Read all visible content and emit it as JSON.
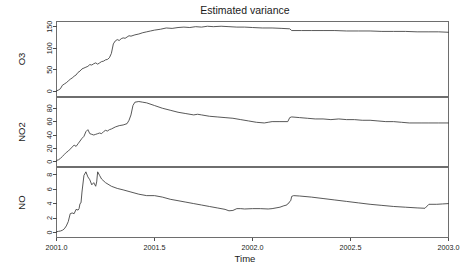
{
  "chart_data": {
    "type": "line",
    "title": "Estimated variance",
    "xlabel": "Time",
    "ylabel": "",
    "grid": false,
    "legend": "none",
    "layout": "3 stacked panels sharing one x axis",
    "xlim": [
      2001.0,
      2003.0
    ],
    "xticks": [
      2001.0,
      2001.5,
      2002.0,
      2002.5,
      2003.0
    ],
    "xticklabels": [
      "2001.0",
      "2001.5",
      "2002.0",
      "2002.5",
      "2003.0"
    ],
    "panels": [
      {
        "name": "O3",
        "ylabel": "O3",
        "ylim": [
          -12,
          162
        ],
        "yticks": [
          0,
          50,
          100,
          150
        ],
        "yticklabels": [
          "0",
          "50",
          "100",
          "150"
        ],
        "series": [
          {
            "name": "O3",
            "x": [
              2001.0,
              2001.01,
              2001.02,
              2001.03,
              2001.04,
              2001.05,
              2001.06,
              2001.07,
              2001.08,
              2001.09,
              2001.1,
              2001.11,
              2001.12,
              2001.13,
              2001.14,
              2001.15,
              2001.16,
              2001.17,
              2001.18,
              2001.19,
              2001.2,
              2001.21,
              2001.22,
              2001.23,
              2001.24,
              2001.25,
              2001.26,
              2001.27,
              2001.28,
              2001.29,
              2001.3,
              2001.31,
              2001.32,
              2001.33,
              2001.34,
              2001.35,
              2001.36,
              2001.37,
              2001.38,
              2001.4,
              2001.42,
              2001.44,
              2001.46,
              2001.48,
              2001.5,
              2001.53,
              2001.56,
              2001.59,
              2001.62,
              2001.65,
              2001.68,
              2001.71,
              2001.74,
              2001.77,
              2001.8,
              2001.84,
              2001.88,
              2001.92,
              2001.96,
              2002.0,
              2002.05,
              2002.1,
              2002.15,
              2002.19,
              2002.2,
              2002.25,
              2002.3,
              2002.36,
              2002.42,
              2002.48,
              2002.54,
              2002.6,
              2002.66,
              2002.72,
              2002.78,
              2002.84,
              2002.9,
              2002.95,
              2003.0
            ],
            "y": [
              1,
              3,
              6,
              14,
              17,
              20,
              24,
              28,
              31,
              35,
              38,
              44,
              47,
              52,
              54,
              56,
              58,
              62,
              61,
              64,
              66,
              63,
              66,
              69,
              70,
              73,
              74,
              78,
              88,
              110,
              117,
              120,
              118,
              122,
              124,
              123,
              126,
              129,
              128,
              131,
              133,
              136,
              138,
              140,
              142,
              144,
              147,
              146,
              148,
              149,
              148,
              150,
              149,
              151,
              150,
              151,
              150,
              149,
              149,
              148,
              147,
              147,
              146,
              145,
              141,
              141,
              141,
              141,
              141,
              140,
              140,
              140,
              139,
              139,
              139,
              138,
              138,
              138,
              137
            ]
          }
        ]
      },
      {
        "name": "NO2",
        "ylabel": "NO2",
        "ylim": [
          -7,
          96
        ],
        "yticks": [
          0,
          20,
          40,
          60,
          80
        ],
        "yticklabels": [
          "0",
          "20",
          "40",
          "60",
          "80"
        ],
        "series": [
          {
            "name": "NO2",
            "x": [
              2001.0,
              2001.01,
              2001.02,
              2001.03,
              2001.04,
              2001.05,
              2001.06,
              2001.07,
              2001.08,
              2001.09,
              2001.1,
              2001.11,
              2001.12,
              2001.13,
              2001.14,
              2001.15,
              2001.16,
              2001.17,
              2001.18,
              2001.19,
              2001.2,
              2001.21,
              2001.22,
              2001.23,
              2001.24,
              2001.25,
              2001.26,
              2001.27,
              2001.28,
              2001.3,
              2001.32,
              2001.34,
              2001.36,
              2001.37,
              2001.38,
              2001.39,
              2001.4,
              2001.42,
              2001.44,
              2001.46,
              2001.5,
              2001.54,
              2001.58,
              2001.62,
              2001.66,
              2001.7,
              2001.72,
              2001.74,
              2001.78,
              2001.82,
              2001.86,
              2001.9,
              2001.94,
              2001.98,
              2002.02,
              2002.06,
              2002.08,
              2002.1,
              2002.14,
              2002.18,
              2002.19,
              2002.2,
              2002.24,
              2002.28,
              2002.32,
              2002.36,
              2002.4,
              2002.44,
              2002.48,
              2002.52,
              2002.56,
              2002.6,
              2002.64,
              2002.68,
              2002.72,
              2002.76,
              2002.8,
              2002.86,
              2002.9,
              2002.95,
              2003.0
            ],
            "y": [
              2,
              3,
              5,
              8,
              11,
              14,
              16,
              19,
              22,
              25,
              23,
              27,
              31,
              35,
              38,
              45,
              48,
              42,
              41,
              40,
              41,
              42,
              43,
              42,
              45,
              47,
              46,
              48,
              49,
              52,
              54,
              55,
              57,
              62,
              70,
              84,
              89,
              90,
              89,
              88,
              84,
              80,
              77,
              74,
              72,
              70,
              71,
              70,
              68,
              67,
              66,
              65,
              63,
              61,
              59,
              58,
              59,
              60,
              60,
              60,
              66,
              67,
              66,
              65,
              64,
              64,
              63,
              64,
              63,
              63,
              62,
              62,
              61,
              60,
              60,
              59,
              58,
              58,
              58,
              58,
              58
            ]
          }
        ]
      },
      {
        "name": "NO",
        "ylabel": "NO",
        "ylim": [
          -0.7,
          9.0
        ],
        "yticks": [
          0,
          2,
          4,
          6,
          8
        ],
        "yticklabels": [
          "0",
          "2",
          "4",
          "6",
          "8"
        ],
        "series": [
          {
            "name": "NO",
            "x": [
              2001.0,
              2001.01,
              2001.02,
              2001.03,
              2001.04,
              2001.05,
              2001.06,
              2001.07,
              2001.08,
              2001.09,
              2001.1,
              2001.11,
              2001.115,
              2001.12,
              2001.125,
              2001.13,
              2001.14,
              2001.15,
              2001.16,
              2001.17,
              2001.18,
              2001.19,
              2001.2,
              2001.205,
              2001.21,
              2001.22,
              2001.23,
              2001.25,
              2001.28,
              2001.31,
              2001.34,
              2001.38,
              2001.42,
              2001.46,
              2001.5,
              2001.54,
              2001.58,
              2001.62,
              2001.66,
              2001.7,
              2001.74,
              2001.78,
              2001.82,
              2001.86,
              2001.88,
              2001.9,
              2001.92,
              2001.94,
              2001.96,
              2002.0,
              2002.04,
              2002.08,
              2002.1,
              2002.12,
              2002.14,
              2002.16,
              2002.175,
              2002.18,
              2002.185,
              2002.19,
              2002.195,
              2002.2,
              2002.21,
              2002.24,
              2002.3,
              2002.36,
              2002.42,
              2002.48,
              2002.54,
              2002.6,
              2002.66,
              2002.72,
              2002.78,
              2002.84,
              2002.88,
              2002.9,
              2002.94,
              2002.97,
              2003.0
            ],
            "y": [
              0.1,
              0.15,
              0.2,
              0.3,
              0.5,
              0.9,
              1.5,
              2.6,
              2.7,
              2.6,
              3.2,
              3.1,
              3.3,
              4.0,
              4.1,
              5.6,
              7.9,
              8.4,
              7.7,
              7.3,
              6.6,
              6.9,
              6.4,
              7.0,
              8.4,
              7.9,
              7.4,
              6.9,
              6.4,
              6.1,
              5.9,
              5.6,
              5.3,
              5.1,
              5.1,
              4.9,
              4.6,
              4.4,
              4.2,
              4.0,
              3.8,
              3.6,
              3.4,
              3.2,
              3.0,
              3.05,
              3.3,
              3.3,
              3.25,
              3.3,
              3.3,
              3.25,
              3.3,
              3.4,
              3.5,
              3.7,
              3.8,
              4.0,
              4.05,
              4.3,
              4.4,
              5.0,
              5.1,
              5.05,
              4.9,
              4.7,
              4.5,
              4.3,
              4.1,
              3.9,
              3.75,
              3.6,
              3.5,
              3.4,
              3.35,
              3.9,
              3.9,
              3.95,
              4.0
            ]
          }
        ]
      }
    ]
  },
  "colors": {
    "line": "#3a3a3a",
    "box": "#6e6e6e",
    "text": "#1a1a1a",
    "background": "#ffffff"
  }
}
